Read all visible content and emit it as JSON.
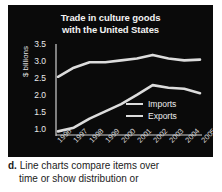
{
  "chart_data": {
    "type": "line",
    "title": "Trade in culture goods with the United States",
    "title_line1": "Trade in culture goods",
    "title_line2": "with the United States",
    "xlabel": "",
    "ylabel": "$ billions",
    "x": [
      "1996",
      "1997",
      "1998",
      "1999",
      "2000",
      "2001",
      "2002",
      "2003",
      "2004",
      "2005"
    ],
    "categories": [
      "1996",
      "1997",
      "1998",
      "1999",
      "2000",
      "2001",
      "2002",
      "2003",
      "2004",
      "2005"
    ],
    "ylim": [
      1.0,
      3.5
    ],
    "yticks": [
      "3.5",
      "3.0",
      "2.5",
      "2.0",
      "1.5",
      "1.0"
    ],
    "ytick_values": [
      3.5,
      3.0,
      2.5,
      2.0,
      1.5,
      1.0
    ],
    "grid": false,
    "legend_position": "inside-right",
    "series": [
      {
        "name": "Imports",
        "color": "#dcdcdc",
        "values": [
          2.6,
          2.85,
          3.0,
          3.0,
          3.05,
          3.1,
          3.2,
          3.1,
          3.05,
          3.07
        ]
      },
      {
        "name": "Exports",
        "color": "#dcdcdc",
        "values": [
          1.1,
          1.2,
          1.45,
          1.65,
          1.85,
          2.1,
          2.37,
          2.3,
          2.27,
          2.15
        ]
      }
    ]
  },
  "panel": {
    "background_color": "#0a0a0a",
    "text_color": "#f2f2f2",
    "line_color": "#dcdcdc"
  },
  "legend": {
    "items": [
      {
        "label": "Imports"
      },
      {
        "label": "Exports"
      }
    ]
  },
  "caption": {
    "letter": "d.",
    "line1": "Line charts compare items over",
    "line2": "time or show distribution or",
    "full_text": "d. Line charts compare items over time or show distribution or"
  }
}
